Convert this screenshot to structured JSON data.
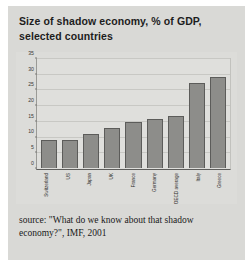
{
  "figure": {
    "title": "Size of shadow economy, % of GDP, selected countries",
    "source": "source: \"What do we know about that shadow economy?\", IMF, 2001",
    "colors": {
      "card": "#d9d9d6",
      "plot_background": "#dfdfdc",
      "bar_fill": "#8d8d8a",
      "bar_edge": "#5c5c5a",
      "gridline": "#c8c8c4"
    }
  },
  "chart_data": {
    "type": "bar",
    "title": "Size of shadow economy, % of GDP, selected countries",
    "xlabel": "",
    "ylabel": "",
    "ylim": [
      0,
      35
    ],
    "yticks": [
      0,
      5,
      10,
      15,
      20,
      25,
      30,
      35
    ],
    "grid": true,
    "legend": null,
    "categories": [
      "Switzerland",
      "US",
      "Japan",
      "UK",
      "France",
      "Germany",
      "OECD average",
      "Italy",
      "Greece"
    ],
    "values": [
      9,
      9,
      11,
      13,
      15,
      16,
      17,
      27.5,
      29.5
    ],
    "annotations": [
      "source: \"What do we know about that shadow economy?\", IMF, 2001"
    ]
  }
}
